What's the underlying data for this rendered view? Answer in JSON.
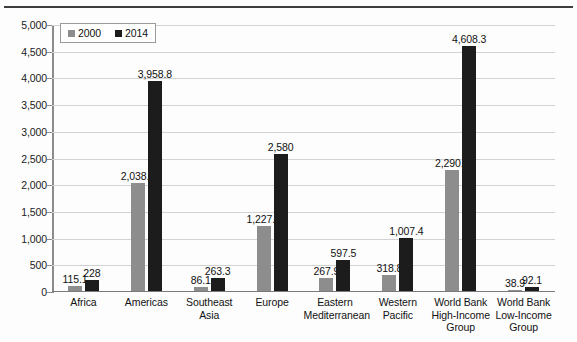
{
  "chart_data": {
    "type": "bar",
    "title": "",
    "xlabel": "",
    "ylabel": "",
    "ylim": [
      0,
      5000
    ],
    "y_ticks": [
      "0",
      "500",
      "1,000",
      "1,500",
      "2,000",
      "2,500",
      "3,000",
      "3,500",
      "4,000",
      "4,500",
      "5,000"
    ],
    "grid": true,
    "legend_position": "top-left",
    "categories": [
      "Africa",
      "Americas",
      "Southeast Asia",
      "Europe",
      "Eastern Mediterranean",
      "Western Pacific",
      "World Bank High-Income Group",
      "World Bank Low-Income Group"
    ],
    "category_lines": [
      [
        "Africa"
      ],
      [
        "Americas"
      ],
      [
        "Southeast",
        "Asia"
      ],
      [
        "Europe"
      ],
      [
        "Eastern",
        "Mediterranean"
      ],
      [
        "Western",
        "Pacific"
      ],
      [
        "World Bank",
        "High-Income",
        "Group"
      ],
      [
        "World Bank",
        "Low-Income",
        "Group"
      ]
    ],
    "series": [
      {
        "name": "2000",
        "color": "#8d8d8d",
        "values": [
          115.1,
          2038.2,
          86.1,
          1227.3,
          267.9,
          318.8,
          2290.4,
          38.9
        ],
        "labels": [
          "115.1",
          "2,038.2",
          "86.1",
          "1,227.3",
          "267.9",
          "318.8",
          "2,290.4",
          "38.9"
        ]
      },
      {
        "name": "2014",
        "color": "#1c1c1c",
        "values": [
          228,
          3958.8,
          263.3,
          2580,
          597.5,
          1007.4,
          4608.3,
          92.1
        ],
        "labels": [
          "228",
          "3,958.8",
          "263.3",
          "2,580",
          "597.5",
          "1,007.4",
          "4,608.3",
          "92.1"
        ]
      }
    ]
  },
  "legend": {
    "items": [
      {
        "label": "2000",
        "color": "#8d8d8d"
      },
      {
        "label": "2014",
        "color": "#1c1c1c"
      }
    ]
  }
}
